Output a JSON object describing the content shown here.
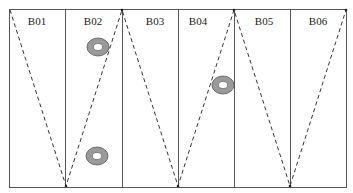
{
  "diagram": {
    "type": "zigzag-survey-layout",
    "cells": [
      {
        "id": "B01",
        "label": "B01"
      },
      {
        "id": "B02",
        "label": "B02"
      },
      {
        "id": "B03",
        "label": "B03"
      },
      {
        "id": "B04",
        "label": "B04"
      },
      {
        "id": "B05",
        "label": "B05"
      },
      {
        "id": "B06",
        "label": "B06"
      }
    ],
    "markers": [
      {
        "cell": "B02",
        "position": "upper"
      },
      {
        "cell": "B02",
        "position": "lower"
      },
      {
        "cell": "B04",
        "position": "middle"
      }
    ],
    "colors": {
      "border": "#333333",
      "path": "#333333",
      "marker_ring": "#999999",
      "marker_center": "#ffffff"
    }
  }
}
